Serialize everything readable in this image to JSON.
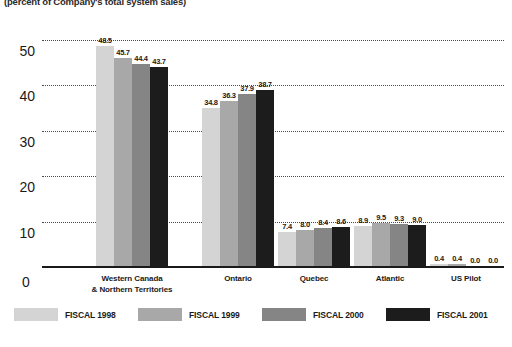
{
  "subtitle": "(percent of Company's total system sales)",
  "chart_data": {
    "type": "bar",
    "title": "",
    "subtitle": "(percent of Company's total system sales)",
    "xlabel": "",
    "ylabel": "",
    "ylim": [
      0,
      55
    ],
    "yticks": [
      0,
      10,
      20,
      30,
      40,
      50
    ],
    "ytick_labels": [
      "0",
      "10",
      "20",
      "30",
      "40",
      "50"
    ],
    "grid": true,
    "legend_position": "bottom",
    "categories": [
      "Western Canada\n& Northern Territories",
      "Ontario",
      "Quebec",
      "Atlantic",
      "US Pilot"
    ],
    "category_lines": [
      [
        "Western Canada",
        "& Northern Territories"
      ],
      [
        "Ontario"
      ],
      [
        "Quebec"
      ],
      [
        "Atlantic"
      ],
      [
        "US Pilot"
      ]
    ],
    "series": [
      {
        "name": "FISCAL 1998",
        "color": "#d4d4d4",
        "values": [
          48.5,
          34.8,
          7.4,
          8.9,
          0.4
        ],
        "labels": [
          "48.5",
          "34.8",
          "7.4",
          "8.9",
          "0.4"
        ]
      },
      {
        "name": "FISCAL 1999",
        "color": "#a8a8a8",
        "values": [
          45.7,
          36.3,
          8.0,
          9.5,
          0.4
        ],
        "labels": [
          "45.7",
          "36.3",
          "8.0",
          "9.5",
          "0.4"
        ]
      },
      {
        "name": "FISCAL 2000",
        "color": "#858585",
        "values": [
          44.4,
          37.9,
          8.4,
          9.3,
          0.0
        ],
        "labels": [
          "44.4",
          "37.9",
          "8.4",
          "9.3",
          "0.0"
        ]
      },
      {
        "name": "FISCAL 2001",
        "color": "#1c1c1c",
        "values": [
          43.7,
          38.7,
          8.6,
          9.0,
          0.0
        ],
        "labels": [
          "43.7",
          "38.7",
          "8.6",
          "9.0",
          "0.0"
        ]
      }
    ]
  }
}
